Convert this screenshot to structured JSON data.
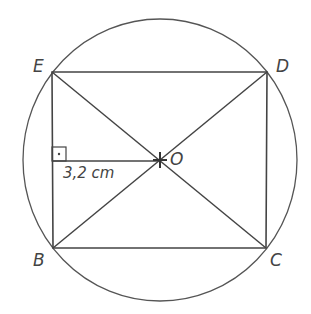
{
  "figure": {
    "vertices": {
      "E": {
        "label": "E",
        "x": 52,
        "y": 72
      },
      "D": {
        "label": "D",
        "x": 267,
        "y": 72
      },
      "B": {
        "label": "B",
        "x": 53,
        "y": 248
      },
      "C": {
        "label": "C",
        "x": 266,
        "y": 248
      }
    },
    "center": {
      "label": "O",
      "x": 160,
      "y": 160
    },
    "measurement": "3,2 cm",
    "right_angle_mark": "·",
    "stroke_color": "#444444"
  }
}
